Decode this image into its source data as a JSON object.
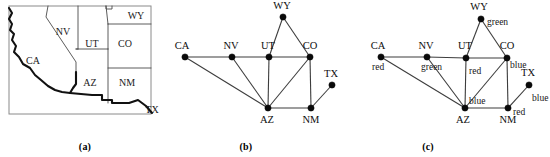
{
  "figure": {
    "captions": {
      "a": "(a)",
      "b": "(b)",
      "c": "(c)"
    }
  },
  "map_panel": {
    "name": "southwestern-us-map",
    "states": [
      {
        "code": "CA",
        "label": "CA",
        "x": 33,
        "y": 62
      },
      {
        "code": "NV",
        "label": "NV",
        "x": 63,
        "y": 33
      },
      {
        "code": "UT",
        "label": "UT",
        "x": 92,
        "y": 45
      },
      {
        "code": "WY",
        "label": "WY",
        "x": 136,
        "y": 17
      },
      {
        "code": "CO",
        "label": "CO",
        "x": 125,
        "y": 45
      },
      {
        "code": "AZ",
        "label": "AZ",
        "x": 90,
        "y": 84
      },
      {
        "code": "NM",
        "label": "NM",
        "x": 127,
        "y": 84
      },
      {
        "code": "TX",
        "label": "TX",
        "x": 152,
        "y": 111
      }
    ]
  },
  "graph_panel": {
    "name": "constraint-graph",
    "nodes": [
      {
        "id": "CA",
        "label": "CA",
        "x": 15,
        "y": 57,
        "label_dx": -3,
        "label_dy": -8
      },
      {
        "id": "NV",
        "label": "NV",
        "x": 62,
        "y": 57,
        "label_dx": -1,
        "label_dy": -8
      },
      {
        "id": "UT",
        "label": "UT",
        "x": 99,
        "y": 57,
        "label_dx": -1,
        "label_dy": -8
      },
      {
        "id": "WY",
        "label": "WY",
        "x": 113,
        "y": 17,
        "label_dx": -1,
        "label_dy": -8
      },
      {
        "id": "CO",
        "label": "CO",
        "x": 140,
        "y": 57,
        "label_dx": 0,
        "label_dy": -8
      },
      {
        "id": "TX",
        "label": "TX",
        "x": 162,
        "y": 85,
        "label_dx": -1,
        "label_dy": -8
      },
      {
        "id": "AZ",
        "label": "AZ",
        "x": 98,
        "y": 108,
        "label_dx": -1,
        "label_dy": 15
      },
      {
        "id": "NM",
        "label": "NM",
        "x": 141,
        "y": 108,
        "label_dx": 0,
        "label_dy": 15
      }
    ],
    "edges": [
      [
        "CA",
        "NV"
      ],
      [
        "CA",
        "AZ"
      ],
      [
        "NV",
        "UT"
      ],
      [
        "NV",
        "AZ"
      ],
      [
        "UT",
        "CO"
      ],
      [
        "UT",
        "WY"
      ],
      [
        "UT",
        "AZ"
      ],
      [
        "WY",
        "CO"
      ],
      [
        "CO",
        "NM"
      ],
      [
        "CO",
        "AZ"
      ],
      [
        "AZ",
        "NM"
      ],
      [
        "NM",
        "TX"
      ]
    ]
  },
  "coloring_panel": {
    "name": "colored-constraint-graph",
    "nodes": [
      {
        "id": "CA",
        "label": "CA",
        "color": "red",
        "x": 31,
        "y": 57,
        "label_dx": -3,
        "label_dy": -8,
        "color_dx": -9,
        "color_dy": 13
      },
      {
        "id": "NV",
        "label": "NV",
        "color": "green",
        "x": 77,
        "y": 57,
        "label_dx": -1,
        "label_dy": -8,
        "color_dx": -6,
        "color_dy": 13
      },
      {
        "id": "UT",
        "label": "UT",
        "color": "red",
        "x": 116,
        "y": 58,
        "label_dx": -1,
        "label_dy": -9,
        "color_dx": 3,
        "color_dy": 16
      },
      {
        "id": "WY",
        "label": "WY",
        "color": "green",
        "x": 131,
        "y": 19,
        "label_dx": -2,
        "label_dy": -9,
        "color_dx": 6,
        "color_dy": 6
      },
      {
        "id": "CO",
        "label": "CO",
        "color": "blue",
        "x": 157,
        "y": 58,
        "label_dx": 0,
        "label_dy": -9,
        "color_dx": 3,
        "color_dy": 10
      },
      {
        "id": "TX",
        "label": "TX",
        "color": "blue",
        "x": 179,
        "y": 85,
        "label_dx": -1,
        "label_dy": -9,
        "color_dx": 3,
        "color_dy": 16
      },
      {
        "id": "AZ",
        "label": "AZ",
        "color": "blue",
        "x": 115,
        "y": 108,
        "label_dx": -2,
        "label_dy": 15,
        "color_dx": 4,
        "color_dy": -4
      },
      {
        "id": "NM",
        "label": "NM",
        "color": "red",
        "x": 158,
        "y": 108,
        "label_dx": 0,
        "label_dy": 15,
        "color_dx": 5,
        "color_dy": 7
      }
    ],
    "edges": [
      [
        "CA",
        "NV"
      ],
      [
        "CA",
        "AZ"
      ],
      [
        "NV",
        "UT"
      ],
      [
        "NV",
        "AZ"
      ],
      [
        "UT",
        "CO"
      ],
      [
        "UT",
        "WY"
      ],
      [
        "UT",
        "AZ"
      ],
      [
        "WY",
        "CO"
      ],
      [
        "CO",
        "NM"
      ],
      [
        "CO",
        "AZ"
      ],
      [
        "AZ",
        "NM"
      ],
      [
        "NM",
        "TX"
      ]
    ],
    "color_values": {
      "red": "red",
      "green": "green",
      "blue": "blue"
    }
  },
  "palette": {
    "ink": "#0d0d0d",
    "state_border": "#4a4a4a",
    "coast_border": "#111111",
    "frame": "#8a8a8a",
    "background": "#ffffff"
  }
}
